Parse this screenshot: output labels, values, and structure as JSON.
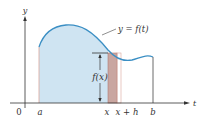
{
  "figure": {
    "curve_label": "y = f(t)",
    "y_axis_label": "y",
    "x_axis_label": "t",
    "origin_label": "0",
    "tick_labels": {
      "a": "a",
      "x": "x",
      "x_plus_h": "x + h",
      "b": "b"
    },
    "height_label": "f(x)",
    "colors": {
      "area_fill": "#cfe4f2",
      "curve": "#3b8fc4",
      "strip_fill": "#c9a6a0",
      "strip_stroke": "#b07a72",
      "axis": "#333333"
    }
  }
}
